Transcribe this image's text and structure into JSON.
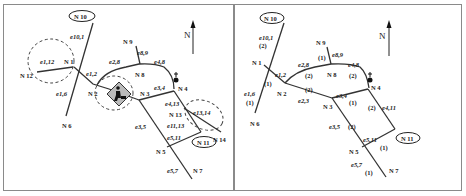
{
  "left_panel": {
    "north_label": "N",
    "nodes": {
      "n10": "N 10",
      "n9": "N 9",
      "n1": "N 1",
      "n12": "N 12",
      "n2": "N 2",
      "n8": "N 8",
      "n3": "N 3",
      "n4": "N 4",
      "n6": "N 6",
      "n13": "N 13",
      "n14": "N 14",
      "n11": "N 11",
      "n5": "N 5",
      "n7": "N 7"
    },
    "edges": {
      "e10_1": "e10,1",
      "e1_12": "e1,12",
      "e1_2": "e1,2",
      "e1_6": "e1,6",
      "e2_8": "e2,8",
      "e8_9": "e8,9",
      "e4_8": "e4,8",
      "e3_4": "e3,4",
      "e4_13": "e4,13",
      "e13_14": "e13,14",
      "e11_13": "e11,13",
      "e3_5": "e3,5",
      "e5_11": "e5,11",
      "e5_7": "e5,7"
    },
    "markers": {
      "highlighted_node": "N 10",
      "destination_node": "N 11",
      "roadwork_icon": "construction-sign",
      "incident_icon": "person-marker"
    }
  },
  "right_panel": {
    "north_label": "N",
    "nodes": {
      "n10": "N 10",
      "n9": "N 9",
      "n1": "N 1",
      "n2": "N 2",
      "n8": "N 8",
      "n3": "N 3",
      "n4": "N 4",
      "n6": "N 6",
      "n11": "N 11",
      "n5": "N 5",
      "n7": "N 7"
    },
    "edges": {
      "e10_1": "e10,1",
      "e1_2": "e1,2",
      "e1_6": "e1,6",
      "e2_8": "e2,8",
      "e2_3": "e2,3",
      "e8_9": "e8,9",
      "e4_8": "e4,8",
      "e3_4": "e3,4",
      "e4_11": "e4,11",
      "e3_5": "e3,5",
      "e5_11": "e5,11",
      "e5_7": "e5,7"
    },
    "weights": {
      "w10_1": "(2)",
      "w1_2": "(1)",
      "w1_6": "(1)",
      "w2_8": "(2)",
      "w2_3": "(2)",
      "w8_9": "(1)",
      "w4_8": "(2)",
      "w3_4": "(1)",
      "w4_11": "(2)",
      "w3_5": "(2)",
      "w5_11": "(1)",
      "w5_7": "(1)"
    },
    "markers": {
      "highlighted_node": "N 10",
      "destination_node": "N 11",
      "incident_icon": "person-marker"
    }
  }
}
